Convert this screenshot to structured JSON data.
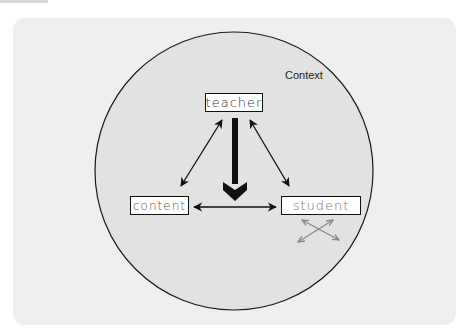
{
  "diagram": {
    "type": "didactic-triangle",
    "context_label": "Context",
    "nodes": {
      "teacher": "teacher",
      "content": "content",
      "student": "student"
    },
    "edges": [
      {
        "from": "teacher",
        "to": "content",
        "style": "double-arrow-thin"
      },
      {
        "from": "teacher",
        "to": "student",
        "style": "double-arrow-thin"
      },
      {
        "from": "content",
        "to": "student",
        "style": "double-arrow-thin"
      },
      {
        "from": "teacher",
        "to": "content-student-edge",
        "style": "single-arrow-bold"
      },
      {
        "from": "student",
        "to": "student",
        "style": "crossed-double-arrows-gray"
      }
    ],
    "colors": {
      "card_bg": "#efefef",
      "circle_fill": "#e2e2e2",
      "stroke": "#111111",
      "peer_arrows": "#888888"
    }
  }
}
